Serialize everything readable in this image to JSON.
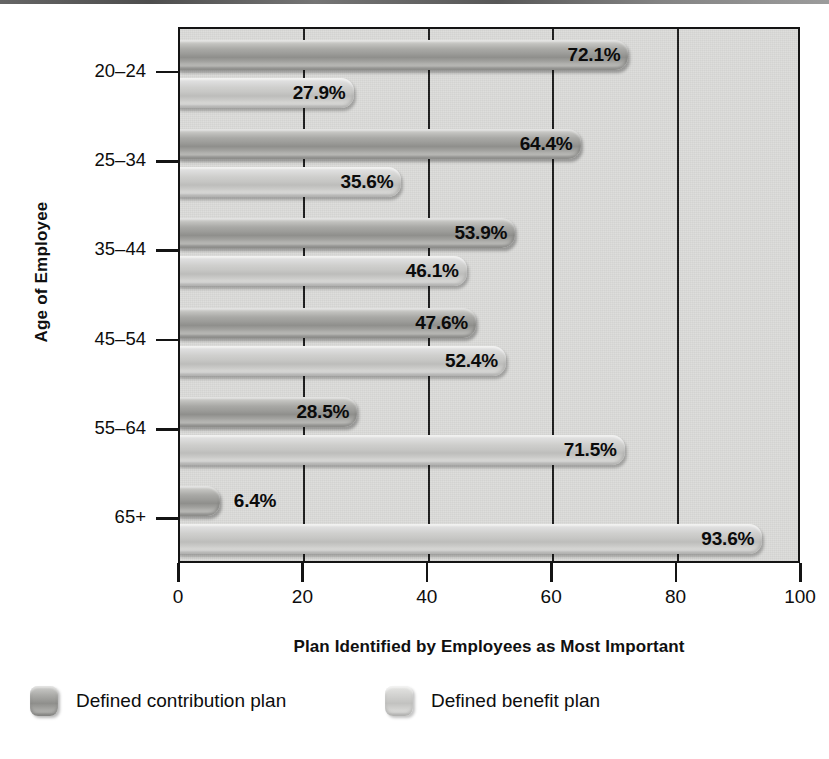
{
  "chart_data": {
    "type": "bar",
    "orientation": "horizontal",
    "title": "",
    "xlabel": "Plan Identified by Employees as Most Important",
    "ylabel": "Age of Employee",
    "categories": [
      "20–24",
      "25–34",
      "35–44",
      "45–54",
      "55–64",
      "65+"
    ],
    "xlim": [
      0,
      100
    ],
    "xticks": [
      0,
      20,
      40,
      60,
      80,
      100
    ],
    "xtick_labels": [
      "0",
      "20",
      "40",
      "60",
      "80",
      "100"
    ],
    "grid": "vertical gridlines at 20, 40, 60, 80",
    "legend_position": "below-plot",
    "series": [
      {
        "name": "Defined contribution plan",
        "color": "#9b9b98",
        "values": [
          72.1,
          64.4,
          53.9,
          47.6,
          28.5,
          6.4
        ],
        "labels": [
          "72.1%",
          "64.4%",
          "53.9%",
          "47.6%",
          "28.5%",
          "6.4%"
        ]
      },
      {
        "name": "Defined benefit plan",
        "color": "#c6c6c4",
        "values": [
          27.9,
          35.6,
          46.1,
          52.4,
          71.5,
          93.6
        ],
        "labels": [
          "27.9%",
          "35.6%",
          "46.1%",
          "52.4%",
          "71.5%",
          "93.6%"
        ]
      }
    ]
  },
  "axes": {
    "y_title": "Age of Employee",
    "x_title": "Plan Identified by Employees as Most Important",
    "y_tick_labels": [
      "20–24",
      "25–34",
      "35–44",
      "45–54",
      "55–64",
      "65+"
    ],
    "x_tick_labels": [
      "0",
      "20",
      "40",
      "60",
      "80",
      "100"
    ]
  },
  "legend": {
    "items": [
      {
        "label": "Defined contribution plan",
        "swatch": "dark"
      },
      {
        "label": "Defined benefit plan",
        "swatch": "light"
      }
    ]
  },
  "colors": {
    "plot_background": "#dcdcda",
    "frame": "#141414",
    "gridline": "#1d1d1d",
    "series_contribution": "#9b9b98",
    "series_benefit": "#c6c6c4",
    "text": "#0d0d0d"
  }
}
